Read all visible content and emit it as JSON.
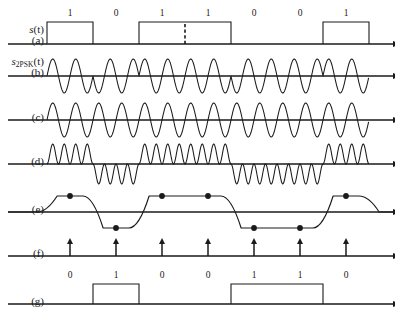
{
  "figure": {
    "axis_label": "t",
    "bit_period_px": 46,
    "origin_x": 47,
    "stroke_color": "#1a1a1a",
    "rows": [
      {
        "id": "a",
        "tag": "(a)",
        "name": "s(t)",
        "name_base": "s",
        "name_sub": "",
        "name_arg": "(t)",
        "type": "baseband-nrz",
        "bits": [
          1,
          0,
          1,
          1,
          0,
          0,
          1
        ],
        "bit_labels": [
          "1",
          "0",
          "1",
          "1",
          "0",
          "0",
          "1"
        ],
        "has_divider_dash": true,
        "divider_after_bit": 3,
        "baseline_y": 44,
        "pulse_height": 22,
        "axis_label": "t"
      },
      {
        "id": "b",
        "tag": "(b)",
        "name": "s2PSK(t)",
        "name_base": "s",
        "name_sub": "2PSK",
        "name_arg": "(t)",
        "type": "psk-carrier",
        "bits": [
          1,
          0,
          1,
          1,
          0,
          0,
          1
        ],
        "baseline_y": 76,
        "amplitude": 17,
        "cycles_per_bit": 2,
        "axis_label": "t"
      },
      {
        "id": "c",
        "tag": "(c)",
        "name": "",
        "name_base": "",
        "name_sub": "",
        "name_arg": "",
        "type": "local-carrier",
        "bits": [
          1,
          1,
          1,
          1,
          1,
          1,
          1
        ],
        "baseline_y": 120,
        "amplitude": 17,
        "cycles_per_bit": 2,
        "axis_label": "t"
      },
      {
        "id": "d",
        "tag": "(d)",
        "name": "",
        "name_base": "",
        "name_sub": "",
        "name_arg": "",
        "type": "product",
        "bits": [
          1,
          0,
          1,
          1,
          0,
          0,
          1
        ],
        "baseline_y": 164,
        "amplitude": 20,
        "cycles_per_bit": 4,
        "axis_label": "t"
      },
      {
        "id": "e",
        "tag": "(e)",
        "name": "",
        "name_base": "",
        "name_sub": "",
        "name_arg": "",
        "type": "lowpass-filtered",
        "bits": [
          1,
          0,
          1,
          1,
          0,
          0,
          1
        ],
        "baseline_y": 212,
        "level": 16,
        "sample_dots": [
          {
            "bit": 0,
            "level": "high"
          },
          {
            "bit": 1,
            "level": "low"
          },
          {
            "bit": 2,
            "level": "high"
          },
          {
            "bit": 3,
            "level": "high"
          },
          {
            "bit": 4,
            "level": "low"
          },
          {
            "bit": 5,
            "level": "low"
          },
          {
            "bit": 6,
            "level": "high"
          }
        ],
        "axis_label": "t"
      },
      {
        "id": "f",
        "tag": "(f)",
        "name": "",
        "name_base": "",
        "name_sub": "",
        "name_arg": "",
        "type": "sampling-pulses",
        "pulse_count": 7,
        "baseline_y": 256,
        "pulse_height": 17,
        "axis_label": "t"
      },
      {
        "id": "g",
        "tag": "(g)",
        "name": "",
        "name_base": "",
        "name_sub": "",
        "name_arg": "",
        "type": "recovered-nrz",
        "bits": [
          0,
          1,
          0,
          0,
          1,
          1,
          0
        ],
        "bit_labels": [
          "0",
          "1",
          "0",
          "0",
          "1",
          "1",
          "0"
        ],
        "baseline_y": 304,
        "pulse_height": 20,
        "axis_label": "t"
      }
    ]
  }
}
